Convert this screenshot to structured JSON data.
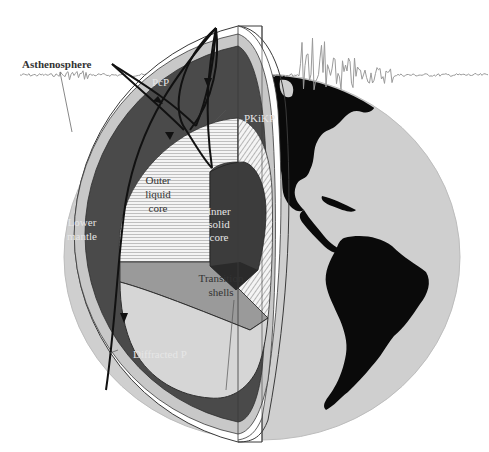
{
  "diagram": {
    "labels": {
      "asthenosphere": "Asthenosphere",
      "pcp": "PcP",
      "pkikp": "PKiKP",
      "outer_core": [
        "Outer",
        "liquid",
        "core"
      ],
      "inner_core": [
        "Inner",
        "solid",
        "core"
      ],
      "lower_mantle": [
        "Lower",
        "mantle"
      ],
      "transition_shells": [
        "Transition",
        "shells"
      ],
      "diffracted_p": "Diffracted P"
    },
    "layers": [
      {
        "name": "Crust / lithosphere",
        "color": "#ffffff"
      },
      {
        "name": "Asthenosphere",
        "color": "#c8c8c8"
      },
      {
        "name": "Lower mantle",
        "color": "#4a4a4a"
      },
      {
        "name": "Outer liquid core",
        "color": "#f2f2f2"
      },
      {
        "name": "Transition shells",
        "color": "#d4d4d4"
      },
      {
        "name": "Inner solid core",
        "color": "#3c3c3c"
      }
    ],
    "rays": [
      "PcP",
      "PKiKP",
      "Diffracted P"
    ],
    "colors": {
      "globe_surface": "#cfcfcf",
      "continents": "#0a0a0a",
      "seismogram": "#9a9a9a",
      "ray": "#111111",
      "outline": "#3a3a3a"
    }
  }
}
